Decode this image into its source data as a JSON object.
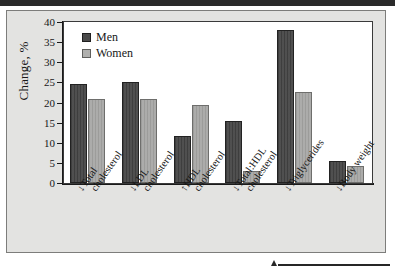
{
  "figure": {
    "panel_bg": "#e3e3e1",
    "plot_bg": "#ffffff",
    "men_color": "#4a4a4a",
    "women_color": "#a8a8a6"
  },
  "chart_data": {
    "type": "bar",
    "title": "",
    "subtitle": "",
    "xlabel": "",
    "ylabel": "Change, %",
    "ylim": [
      0,
      40
    ],
    "yticks": [
      0,
      5,
      10,
      15,
      20,
      25,
      30,
      35,
      40
    ],
    "ytick_labels": [
      "0",
      "5",
      "10",
      "15",
      "20",
      "25",
      "30",
      "35",
      "40"
    ],
    "grid": false,
    "legend_position": "top-left",
    "categories": [
      "↓Total cholesterol",
      "↓LDL cholesterol",
      "↑HDL cholesterol",
      "↓Total:HDL cholesterol",
      "↓Triglycerides",
      "↓Body weight"
    ],
    "category_lines": [
      [
        "↓Total",
        "cholesterol"
      ],
      [
        "↓LDL",
        "cholesterol"
      ],
      [
        "↑HDL",
        "cholesterol"
      ],
      [
        "↓Total:HDL",
        "cholesterol"
      ],
      [
        "↓Triglycerides",
        ""
      ],
      [
        "↓Body weight",
        ""
      ]
    ],
    "series": [
      {
        "name": "Men",
        "color": "#4a4a4a",
        "values": [
          24.5,
          25.0,
          11.7,
          15.3,
          38.0,
          5.5
        ]
      },
      {
        "name": "Women",
        "color": "#a8a8a6",
        "values": [
          20.8,
          20.8,
          19.5,
          2.9,
          22.6,
          4.3
        ]
      }
    ]
  },
  "legend": {
    "entries": [
      {
        "label": "Men"
      },
      {
        "label": "Women"
      }
    ]
  }
}
